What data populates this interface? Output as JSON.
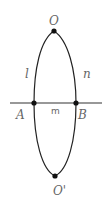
{
  "diagram": {
    "points": {
      "O": {
        "label": "O",
        "x": 54,
        "y": 31
      },
      "O_prime": {
        "label": "O'",
        "x": 55,
        "y": 176
      },
      "A": {
        "label": "A",
        "x": 34,
        "y": 103
      },
      "B": {
        "label": "B",
        "x": 76,
        "y": 103
      }
    },
    "curves": {
      "l": {
        "label": "l"
      },
      "n": {
        "label": "n"
      }
    },
    "line": {
      "label": "m"
    },
    "colors": {
      "stroke": "#222222",
      "label": "#666666"
    }
  }
}
